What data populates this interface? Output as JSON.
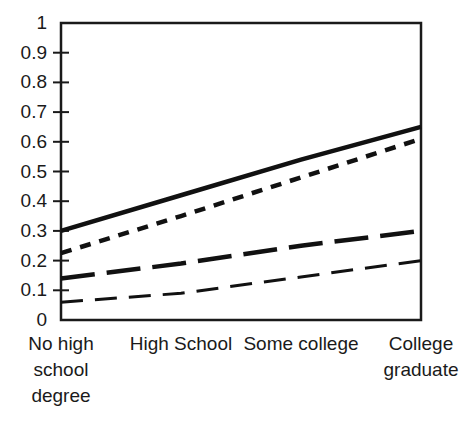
{
  "chart_data": {
    "type": "line",
    "title": "",
    "xlabel": "",
    "ylabel": "",
    "categories": [
      "No high school degree",
      "High School",
      "Some college",
      "College graduate"
    ],
    "category_lines": [
      [
        "No high",
        "school",
        "degree"
      ],
      [
        "High School"
      ],
      [
        "Some college"
      ],
      [
        "College",
        "graduate"
      ]
    ],
    "x": [
      0,
      1,
      2,
      3
    ],
    "ylim": [
      0,
      1
    ],
    "xlim": [
      0,
      3
    ],
    "yticks": [
      0,
      0.1,
      0.2,
      0.3,
      0.4,
      0.5,
      0.6,
      0.7,
      0.8,
      0.9,
      1
    ],
    "ytick_labels": [
      "0",
      "0.1",
      "0.2",
      "0.3",
      "0.4",
      "0.5",
      "0.6",
      "0.7",
      "0.8",
      "0.9",
      "1"
    ],
    "grid": false,
    "legend": "none",
    "axis_color": "#1a1a1a",
    "series": [
      {
        "name": "series-1",
        "style": "solid",
        "color": "#111111",
        "width": 4.5,
        "dasharray": "none",
        "values": [
          0.3,
          0.42,
          0.54,
          0.65
        ]
      },
      {
        "name": "series-2",
        "style": "short-dash",
        "color": "#111111",
        "width": 4.5,
        "dasharray": "11,9",
        "values": [
          0.225,
          0.35,
          0.48,
          0.61
        ]
      },
      {
        "name": "series-3",
        "style": "long-dash",
        "color": "#111111",
        "width": 4.5,
        "dasharray": "34,12",
        "values": [
          0.14,
          0.19,
          0.25,
          0.3
        ]
      },
      {
        "name": "series-4",
        "style": "medium-dash",
        "color": "#111111",
        "width": 3,
        "dasharray": "22,12",
        "values": [
          0.06,
          0.09,
          0.145,
          0.2
        ]
      }
    ]
  }
}
